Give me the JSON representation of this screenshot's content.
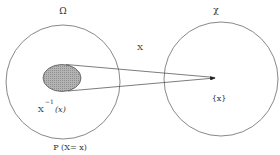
{
  "diagram": {
    "sample_space": {
      "label": "Ω"
    },
    "codomain": {
      "label": "χ"
    },
    "mapping": {
      "label": "X"
    },
    "preimage": {
      "base": "X",
      "superscript": "−1",
      "arg": "(x)"
    },
    "image_point": {
      "label": "{x}"
    },
    "probability": {
      "label": "P (X= x)"
    },
    "colors": {
      "stroke": "#555555",
      "fill": "#a8a8a8",
      "text": "#333333"
    }
  }
}
